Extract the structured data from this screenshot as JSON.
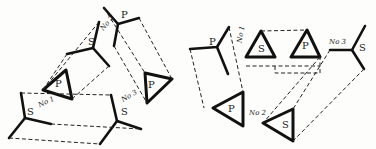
{
  "diagram": {
    "left_figure": {
      "labels": [
        {
          "text": "P",
          "x": 123,
          "y": 16,
          "kind": "fork"
        },
        {
          "text": "No 2",
          "x": 99,
          "y": 25,
          "kind": "number"
        },
        {
          "text": "S",
          "x": 89,
          "y": 41,
          "kind": "fork"
        },
        {
          "text": "P",
          "x": 57,
          "y": 79,
          "kind": "triangle"
        },
        {
          "text": "No 1",
          "x": 39,
          "y": 101,
          "kind": "number"
        },
        {
          "text": "P",
          "x": 148,
          "y": 80,
          "kind": "triangle"
        },
        {
          "text": "No 3",
          "x": 122,
          "y": 96,
          "kind": "number"
        },
        {
          "text": "S",
          "x": 26,
          "y": 109,
          "kind": "fork"
        },
        {
          "text": "S",
          "x": 120,
          "y": 111,
          "kind": "fork"
        }
      ]
    },
    "right_figure": {
      "labels": [
        {
          "text": "P",
          "x": 211,
          "y": 38,
          "kind": "fork"
        },
        {
          "text": "No 1",
          "x": 234,
          "y": 34,
          "kind": "number"
        },
        {
          "text": "S",
          "x": 259,
          "y": 45,
          "kind": "triangle"
        },
        {
          "text": "P",
          "x": 302,
          "y": 42,
          "kind": "triangle"
        },
        {
          "text": "No 3",
          "x": 329,
          "y": 38,
          "kind": "number"
        },
        {
          "text": "S",
          "x": 358,
          "y": 44,
          "kind": "fork"
        },
        {
          "text": "P",
          "x": 229,
          "y": 106,
          "kind": "triangle"
        },
        {
          "text": "No 2",
          "x": 249,
          "y": 111,
          "kind": "number"
        },
        {
          "text": "S",
          "x": 283,
          "y": 120,
          "kind": "triangle"
        }
      ]
    }
  }
}
